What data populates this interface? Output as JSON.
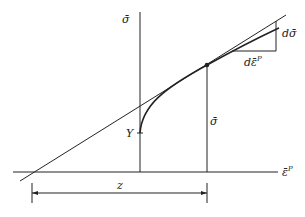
{
  "diagram": {
    "type": "stress-strain hardening curve with tangent construction",
    "labels": {
      "y_axis": "σ̄",
      "x_axis": "ε̄",
      "x_axis_sup": "P",
      "yield": "Y",
      "stress_at_point": "σ̄",
      "d_sigma": "dσ̄",
      "d_eps": "dε̄",
      "d_eps_sup": "P",
      "z": "z"
    },
    "colors": {
      "line": "#222222",
      "background": "#ffffff"
    }
  }
}
